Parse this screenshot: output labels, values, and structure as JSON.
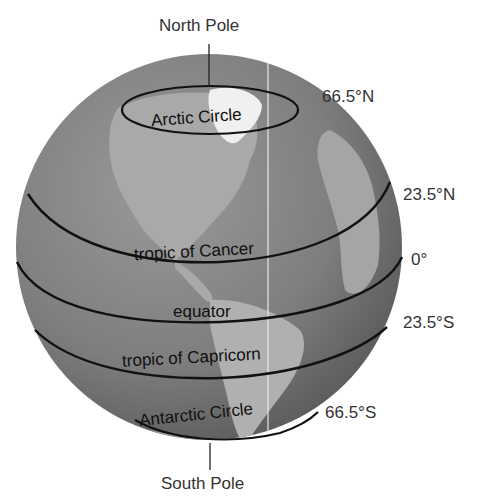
{
  "diagram": {
    "colors": {
      "ocean": "#7d7d7d",
      "land": "#a8a8a8",
      "ice": "#f2f2f2",
      "line": "#111111",
      "text": "#333333"
    },
    "poles": {
      "north": "North Pole",
      "south": "South Pole"
    },
    "circles": [
      {
        "name": "Arctic Circle",
        "latitude": "66.5°N"
      },
      {
        "name": "tropic of Cancer",
        "latitude": "23.5°N"
      },
      {
        "name": "equator",
        "latitude": "0°"
      },
      {
        "name": "tropic of Capricorn",
        "latitude": "23.5°S"
      },
      {
        "name": "Antarctic Circle",
        "latitude": "66.5°S"
      }
    ]
  }
}
